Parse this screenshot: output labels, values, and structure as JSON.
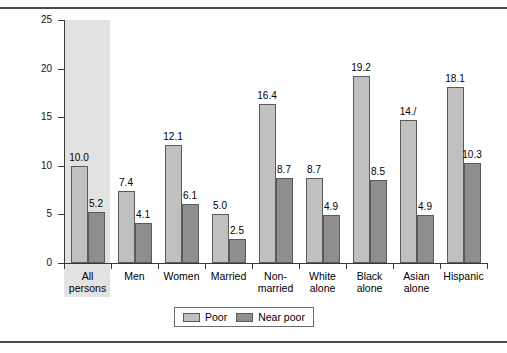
{
  "chart_data": {
    "type": "bar",
    "title": "",
    "xlabel": "",
    "ylabel": "Percent",
    "ylim": [
      0,
      25
    ],
    "yticks": [
      "0",
      "5",
      "10",
      "15",
      "20",
      "25"
    ],
    "grid": false,
    "legend_position": "bottom-center",
    "categories": [
      "All persons",
      "Men",
      "Women",
      "Married",
      "Non-married",
      "White alone",
      "Black alone",
      "Asian alone",
      "Hispanic"
    ],
    "category_lines": [
      [
        "All",
        "persons"
      ],
      [
        "Men",
        ""
      ],
      [
        "Women",
        ""
      ],
      [
        "Married",
        ""
      ],
      [
        "Non-",
        "married"
      ],
      [
        "White",
        "alone"
      ],
      [
        "Black",
        "alone"
      ],
      [
        "Asian",
        "alone"
      ],
      [
        "Hispanic",
        ""
      ]
    ],
    "highlighted_category": "All persons",
    "series": [
      {
        "name": "Poor",
        "color": "#c0c0c0",
        "values": [
          10.0,
          7.4,
          12.1,
          5.0,
          16.4,
          8.7,
          19.2,
          14.7,
          18.1
        ],
        "labels": [
          "10.0",
          "7.4",
          "12.1",
          "5.0",
          "16.4",
          "8.7",
          "19.2",
          "14./",
          "18.1"
        ]
      },
      {
        "name": "Near poor",
        "color": "#8e8e8e",
        "values": [
          5.2,
          4.1,
          6.1,
          2.5,
          8.7,
          4.9,
          8.5,
          4.9,
          10.3
        ],
        "labels": [
          "5.2",
          "4.1",
          "6.1",
          "2.5",
          "8.7",
          "4.9",
          "8.5",
          "4.9",
          "10.3"
        ]
      }
    ],
    "legend": [
      {
        "label": "Poor",
        "color": "#c0c0c0"
      },
      {
        "label": "Near poor",
        "color": "#8e8e8e"
      }
    ]
  }
}
